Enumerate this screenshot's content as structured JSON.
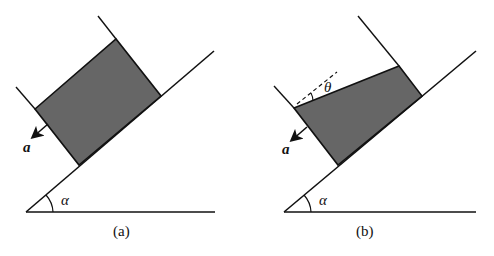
{
  "colors": {
    "line": "#111111",
    "block_fill": "#666666",
    "background": "#ffffff"
  },
  "panels": [
    {
      "caption": "(a)",
      "angle_label": "α",
      "accel_label": "a",
      "description": "Rectangular block of fluid in a container accelerating down an incline; free surface parallel to incline"
    },
    {
      "caption": "(b)",
      "angle_label": "α",
      "accel_label": "a",
      "surface_angle_label": "θ",
      "description": "Fluid in container accelerating down incline; free surface tilted at angle θ relative to container wall normal"
    }
  ]
}
